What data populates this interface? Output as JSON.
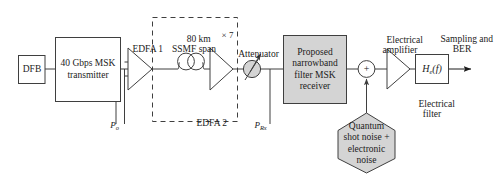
{
  "figure": {
    "type": "block-diagram",
    "domain": "optical-communication-system",
    "background_color": "#ffffff",
    "line_color": "#3f3f3f",
    "text_color": "#1b1b1b",
    "shaded_fill": "#d4d4d4"
  },
  "blocks": {
    "dfb": {
      "label": "DFB",
      "shape": "rectangle",
      "fill": "white"
    },
    "transmitter": {
      "line1": "40 Gbps MSK",
      "line2": "transmitter",
      "shape": "rectangle",
      "fill": "white"
    },
    "edfa1": {
      "label": "EDFA 1",
      "shape": "triangle-amplifier"
    },
    "edfa2": {
      "label": "EDFA 2",
      "shape": "triangle-amplifier"
    },
    "fiber_span": {
      "line1": "80 km",
      "line2": "SSMF span",
      "shape": "fiber-spool"
    },
    "repeat": {
      "label": "× 7"
    },
    "attenuator": {
      "label": "Attenuator",
      "shape": "circle-with-arrow",
      "fill": "#d4d4d4"
    },
    "receiver": {
      "line1": "Proposed",
      "line2": "narrowband",
      "line3": "filter MSK",
      "line4": "receiver",
      "shape": "rectangle",
      "fill": "#d4d4d4"
    },
    "summing_node": {
      "label": "+",
      "shape": "circle"
    },
    "noise_source": {
      "line1": "Quantum",
      "line2": "shot noise +",
      "line3": "electronic",
      "line4": "noise",
      "shape": "hexagon",
      "fill": "#d4d4d4"
    },
    "electrical_amplifier": {
      "line1": "Electrical",
      "line2": "amplifier",
      "shape": "triangle-amplifier"
    },
    "electrical_filter": {
      "symbol_h": "H",
      "symbol_sub": "e",
      "symbol_arg": "(f)",
      "line1": "Electrical",
      "line2": "filter",
      "shape": "rectangle",
      "fill": "white"
    },
    "output": {
      "line1": "Sampling and",
      "line2": "BER"
    }
  },
  "power_labels": {
    "p_out": {
      "symbol": "P",
      "subscript": "o"
    },
    "p_rx": {
      "symbol": "P",
      "subscript": "Rx"
    }
  },
  "groups": {
    "span_loop": {
      "style": "dashed-rectangle",
      "multiplier": "× 7"
    }
  }
}
